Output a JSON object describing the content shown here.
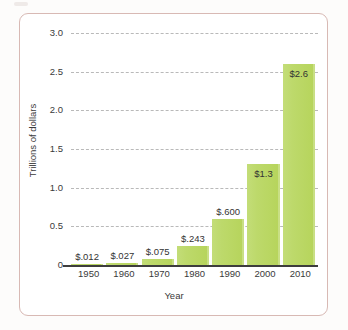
{
  "chart_data": {
    "type": "bar",
    "title": "",
    "xlabel": "Year",
    "ylabel": "Trillions of dollars",
    "categories": [
      "1950",
      "1960",
      "1970",
      "1980",
      "1990",
      "2000",
      "2010"
    ],
    "values": [
      0.012,
      0.027,
      0.075,
      0.243,
      0.6,
      1.3,
      2.6
    ],
    "value_labels": [
      "$.012",
      "$.027",
      "$.075",
      "$.243",
      "$.600",
      "$1.3",
      "$2.6"
    ],
    "label_placement": [
      "above",
      "above",
      "above",
      "above",
      "above",
      "inside",
      "inside"
    ],
    "ylim": [
      0,
      3.0
    ],
    "yticks": [
      "0",
      "0.5",
      "1.0",
      "1.5",
      "2.0",
      "2.5",
      "3.0"
    ],
    "ytick_values": [
      0,
      0.5,
      1.0,
      1.5,
      2.0,
      2.5,
      3.0
    ],
    "grid": true,
    "legend": false,
    "bar_color": "#b6d45b",
    "grid_color": "#b9b9b9",
    "axis_color": "#3d3d3d",
    "frame_color": "#d8b9b4"
  }
}
